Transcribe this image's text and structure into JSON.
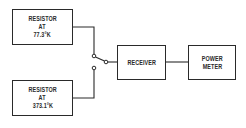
{
  "diagram": {
    "type": "block-diagram",
    "blocks": [
      {
        "id": "resistor-cold",
        "lines": [
          "RESISTOR",
          "AT",
          "77.3°K"
        ]
      },
      {
        "id": "resistor-hot",
        "lines": [
          "RESISTOR",
          "AT",
          "373.1°K"
        ]
      },
      {
        "id": "receiver",
        "lines": [
          "RECEIVER"
        ]
      },
      {
        "id": "power-meter",
        "lines": [
          "POWER",
          "METER"
        ]
      }
    ],
    "switch": {
      "positions": 2,
      "selected": "resistor-cold"
    },
    "connections": [
      [
        "resistor-cold",
        "switch"
      ],
      [
        "resistor-hot",
        "switch"
      ],
      [
        "switch",
        "receiver"
      ],
      [
        "receiver",
        "power-meter"
      ]
    ],
    "colors": {
      "line": "#2a2a2a",
      "background": "#ffffff"
    }
  }
}
